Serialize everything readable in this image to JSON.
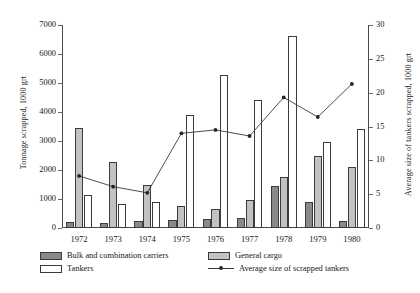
{
  "chart_data": {
    "type": "bar",
    "title": "",
    "xlabel": "",
    "categories": [
      "1972",
      "1973",
      "1974",
      "1975",
      "1976",
      "1977",
      "1978",
      "1979",
      "1980"
    ],
    "ylabel": "Tonnage scrapped, 1000 grt",
    "ylim": [
      0,
      7000
    ],
    "ytick_labels": [
      "0",
      "1000",
      "2000",
      "3000",
      "4000",
      "5000",
      "6000",
      "7000"
    ],
    "y2label": "Average size of tankers scrapped, 1000 grt",
    "y2lim": [
      0,
      30
    ],
    "y2tick_labels": [
      "0",
      "5",
      "10",
      "15",
      "20",
      "25",
      "30"
    ],
    "grid": false,
    "legend_position": "below-axis",
    "series": [
      {
        "name": "Bulk and combination carriers",
        "type": "bar",
        "axis": "left",
        "color": "#898989",
        "values": [
          200,
          180,
          230,
          260,
          300,
          330,
          1450,
          900,
          230
        ]
      },
      {
        "name": "General cargo",
        "type": "bar",
        "axis": "left",
        "color": "#c2c2c2",
        "values": [
          3450,
          2280,
          1480,
          760,
          640,
          950,
          1770,
          2500,
          2100
        ]
      },
      {
        "name": "Tankers",
        "type": "bar",
        "axis": "left",
        "color": "#ffffff",
        "values": [
          1150,
          840,
          880,
          3880,
          5280,
          4420,
          6620,
          2950,
          3400
        ]
      },
      {
        "name": "Average size of scrapped tankers",
        "type": "line",
        "axis": "right",
        "color": "#3a3a3a",
        "values": [
          7.7,
          6.1,
          5.2,
          14.0,
          14.5,
          13.6,
          19.3,
          16.4,
          21.3
        ]
      }
    ]
  },
  "legend": {
    "items": [
      {
        "label": "Bulk and combination carriers",
        "marker": "swatch-dark"
      },
      {
        "label": "General cargo",
        "marker": "swatch-mid"
      },
      {
        "label": "Tankers",
        "marker": "swatch-light"
      },
      {
        "label": "Average size of scrapped tankers",
        "marker": "line-marker"
      }
    ]
  }
}
